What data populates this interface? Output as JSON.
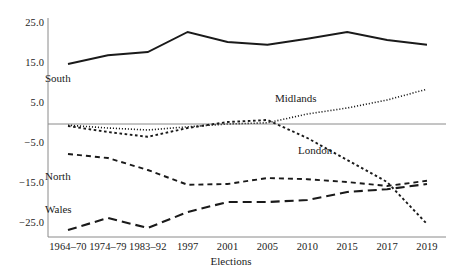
{
  "chart_data": {
    "type": "line",
    "title": "",
    "xlabel": "Elections",
    "ylabel": "",
    "categories": [
      "1964–70",
      "1974–79",
      "1983–92",
      "1997",
      "2001",
      "2005",
      "2010",
      "2015",
      "2017",
      "2019"
    ],
    "yticks": [
      25.0,
      15.0,
      5.0,
      -5.0,
      -15.0,
      -25.0
    ],
    "ytick_labels": [
      "25.0",
      "15.0",
      "5.0",
      "−5.0",
      "−15.0",
      "−25.0"
    ],
    "ylim": [
      -28.5,
      28.0
    ],
    "grid": false,
    "zero_line": true,
    "legend": "inline-annotations",
    "series": [
      {
        "name": "South",
        "style": "solid",
        "color": "#1a1a1a",
        "values": [
          15.0,
          17.2,
          18.0,
          23.0,
          20.5,
          19.8,
          21.3,
          23.0,
          21.0,
          19.8
        ]
      },
      {
        "name": "Midlands",
        "style": "fine-dotted",
        "color": "#1a1a1a",
        "values": [
          -0.3,
          -1.0,
          -1.5,
          -0.7,
          0.0,
          0.3,
          2.5,
          4.0,
          6.0,
          8.7
        ]
      },
      {
        "name": "London",
        "style": "dotted",
        "color": "#1a1a1a",
        "values": [
          -0.5,
          -2.0,
          -3.2,
          -1.0,
          0.5,
          1.0,
          -3.5,
          -9.0,
          -14.5,
          -25.0
        ]
      },
      {
        "name": "North",
        "style": "dashed",
        "color": "#1a1a1a",
        "values": [
          -7.5,
          -8.5,
          -11.5,
          -15.2,
          -15.0,
          -13.5,
          -13.8,
          -14.5,
          -15.5,
          -14.2
        ]
      },
      {
        "name": "Wales",
        "style": "long-dashed",
        "color": "#1a1a1a",
        "values": [
          -26.5,
          -23.5,
          -26.0,
          -22.0,
          -19.5,
          -19.5,
          -19.0,
          -17.0,
          -16.3,
          -15.0
        ]
      }
    ],
    "annotations": [
      {
        "text": "South",
        "x_px": 45,
        "y_px": 72
      },
      {
        "text": "Midlands",
        "x_px": 275,
        "y_px": 92
      },
      {
        "text": "London",
        "x_px": 298,
        "y_px": 144
      },
      {
        "text": "North",
        "x_px": 45,
        "y_px": 170
      },
      {
        "text": "Wales",
        "x_px": 45,
        "y_px": 203
      }
    ]
  }
}
